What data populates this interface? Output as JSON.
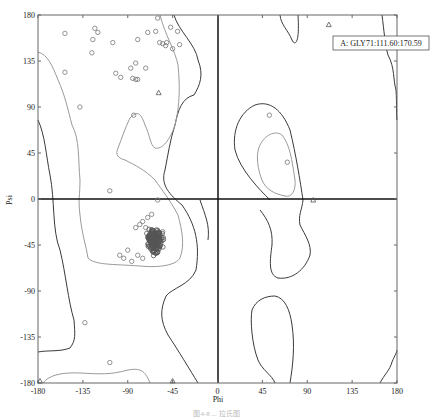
{
  "chart_data": {
    "type": "scatter",
    "title": "",
    "subtitle": "Ramachandran plot",
    "xlabel": "Phi",
    "ylabel": "Psi",
    "xlim": [
      -180,
      180
    ],
    "ylim": [
      -180,
      180
    ],
    "x_ticks": [
      -180,
      -135,
      -90,
      -45,
      0,
      45,
      90,
      135,
      180
    ],
    "y_ticks": [
      180,
      135,
      90,
      45,
      0,
      -45,
      -90,
      -135,
      -180
    ],
    "x_tick_labels": [
      "-180",
      "-135",
      "-90",
      "-45",
      "0",
      "45",
      "90",
      "135",
      "180"
    ],
    "y_tick_labels": [
      "180",
      "135",
      "90",
      "45",
      "0",
      "-45",
      "-90",
      "-135",
      "-180"
    ],
    "grid": false,
    "zero_lines": true,
    "annotation": {
      "label": "A: GLY71:111.60:170.59",
      "marker": "triangle",
      "phi": 111.6,
      "psi": 170.59
    },
    "series": [
      {
        "name": "residues (general)",
        "marker": "circle",
        "points": [
          [
            -153,
            162
          ],
          [
            -123,
            167
          ],
          [
            -120,
            163
          ],
          [
            -125,
            156
          ],
          [
            -126,
            143
          ],
          [
            -105,
            153
          ],
          [
            -80,
            156
          ],
          [
            -60,
            177
          ],
          [
            -70,
            163
          ],
          [
            -62,
            164
          ],
          [
            -58,
            153
          ],
          [
            -55,
            152
          ],
          [
            -52,
            150
          ],
          [
            -51,
            153
          ],
          [
            -45,
            147
          ],
          [
            -47,
            168
          ],
          [
            -40,
            164
          ],
          [
            -38,
            151
          ],
          [
            -82,
            133
          ],
          [
            -72,
            128
          ],
          [
            -87,
            128
          ],
          [
            -102,
            123
          ],
          [
            -97,
            119
          ],
          [
            -85,
            118
          ],
          [
            -82,
            117
          ],
          [
            -80,
            117
          ],
          [
            -153,
            124
          ],
          [
            -138,
            90
          ],
          [
            -84,
            82
          ],
          [
            -108,
            8
          ],
          [
            -60,
            -1
          ],
          [
            -108,
            -160
          ],
          [
            -133,
            -121
          ],
          [
            -86,
            -61
          ],
          [
            -94,
            -58
          ],
          [
            -98,
            -55
          ],
          [
            -90,
            -50
          ],
          [
            -80,
            -55
          ],
          [
            -75,
            -58
          ],
          [
            -75,
            -22
          ],
          [
            -70,
            -18
          ],
          [
            -66,
            -15
          ],
          [
            -72,
            -28
          ],
          [
            -78,
            -25
          ],
          [
            -82,
            -28
          ],
          [
            -55,
            -32
          ],
          [
            -58,
            -38
          ]
        ]
      },
      {
        "name": "alpha-helix cluster",
        "marker": "circle",
        "center": [
          -63,
          -41
        ],
        "spread": [
          8,
          10
        ],
        "count": 180
      },
      {
        "name": "glycine",
        "marker": "triangle",
        "points": [
          [
            -59,
            104
          ],
          [
            111.6,
            170.59
          ],
          [
            96,
            -1
          ],
          [
            -178,
            -178
          ],
          [
            -45,
            -178
          ]
        ]
      },
      {
        "name": "right-side points",
        "marker": "circle",
        "points": [
          [
            52,
            82
          ],
          [
            70,
            36
          ]
        ]
      }
    ],
    "contours": {
      "core_color": "#3a3a3a",
      "allowed_color": "#9a9a9a"
    }
  },
  "axes": {
    "x_label": "Phi",
    "y_label": "Psi"
  },
  "annotation_box": {
    "text": "A: GLY71:111.60:170.59"
  },
  "caption": "图4-8  ...  拉氏图"
}
